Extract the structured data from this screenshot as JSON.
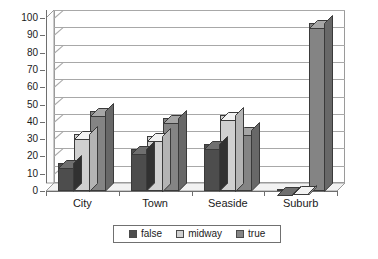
{
  "chart_data": {
    "type": "bar",
    "title": "",
    "subtitle": "",
    "xlabel": "",
    "ylabel": "",
    "categories": [
      "City",
      "Town",
      "Seaside",
      "Suburb"
    ],
    "series": [
      {
        "name": "false",
        "color": "#4d4d4d",
        "values": [
          16,
          24,
          27,
          0
        ]
      },
      {
        "name": "midway",
        "color": "#d0d0d0",
        "values": [
          33,
          32,
          44,
          1
        ]
      },
      {
        "name": "true",
        "color": "#848484",
        "values": [
          46,
          42,
          35,
          97
        ]
      }
    ],
    "ylim": [
      0,
      100
    ],
    "ytick_step": 10,
    "yticks": [
      0,
      10,
      20,
      30,
      40,
      50,
      60,
      70,
      80,
      90,
      100
    ],
    "ytick_labels": [
      "0",
      "10",
      "20",
      "30",
      "40",
      "50",
      "60",
      "70",
      "80",
      "90",
      "100"
    ],
    "grid": true,
    "grid_axis": "y",
    "legend_position": "bottom",
    "style": "3d-bar",
    "background": "#ffffff",
    "axis_color": "#6e6e6e",
    "grid_color": "#a8a8a8"
  },
  "legend": {
    "entries": [
      {
        "label": "false"
      },
      {
        "label": "midway"
      },
      {
        "label": "true"
      }
    ]
  }
}
